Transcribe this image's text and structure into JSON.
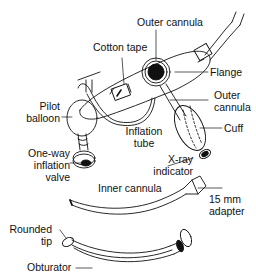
{
  "diagram": {
    "labels": {
      "outer_cannula_top": "Outer cannula",
      "cotton_tape": "Cotton tape",
      "flange": "Flange",
      "pilot_balloon_1": "Pilot",
      "pilot_balloon_2": "balloon",
      "outer_cannula_1": "Outer",
      "outer_cannula_2": "cannula",
      "inflation_tube_1": "Inflation",
      "inflation_tube_2": "tube",
      "cuff": "Cuff",
      "one_way_1": "One-way",
      "one_way_2": "inflation",
      "one_way_3": "valve",
      "xray_1": "X-ray",
      "xray_2": "indicator",
      "inner_cannula": "Inner cannula",
      "adapter_1": "15 mm",
      "adapter_2": "adapter",
      "rounded_tip_1": "Rounded",
      "rounded_tip_2": "tip",
      "obturator": "Obturator"
    },
    "colors": {
      "line": "#111111",
      "background": "#ffffff"
    }
  }
}
